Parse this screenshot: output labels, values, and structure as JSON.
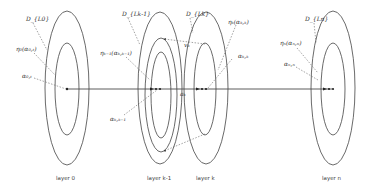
{
  "diagram": {
    "layers": [
      {
        "id": "layer0",
        "label": "layer 0",
        "domain_label": "D_{L0}",
        "eta_label": "η₀(α₀,ₜ)",
        "alpha_label": "α₀,ₜ"
      },
      {
        "id": "layerk1",
        "label": "layer k-1",
        "domain_label": "D_{Lk-1}",
        "eta_label": "ηₖ₋₁(αₖ,ₖ₋₁)",
        "alpha_label": "αₖ,ₖ₋₁"
      },
      {
        "id": "layerk",
        "label": "layer k",
        "domain_label": "D_{Lk}",
        "eta_label": "ηₖ(αₖ,ₖ)",
        "alpha_label": "αₖ,ₖ"
      },
      {
        "id": "layern",
        "label": "layer n",
        "domain_label": "D_{Ln}",
        "eta_label": "ηₙ(αₙ,ₙ)",
        "alpha_label": "αₙ,ₙ"
      }
    ],
    "edge_labels": {
      "vk": "vₖ",
      "ak": "aₖ"
    }
  }
}
